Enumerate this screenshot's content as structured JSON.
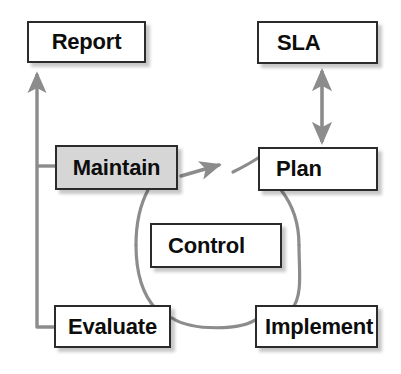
{
  "diagram": {
    "colors": {
      "background": "#ffffff",
      "box_border": "#2b2b2b",
      "box_fill": "#ffffff",
      "highlight_fill": "#d6d6d6",
      "connector": "#8c8c8c",
      "text": "#0d0d0d"
    },
    "nodes": [
      {
        "id": "report",
        "label": "Report",
        "highlighted": false
      },
      {
        "id": "sla",
        "label": "SLA",
        "highlighted": false
      },
      {
        "id": "maintain",
        "label": "Maintain",
        "highlighted": true
      },
      {
        "id": "plan",
        "label": "Plan",
        "highlighted": false
      },
      {
        "id": "control",
        "label": "Control",
        "highlighted": false
      },
      {
        "id": "evaluate",
        "label": "Evaluate",
        "highlighted": false
      },
      {
        "id": "implement",
        "label": "Implement",
        "highlighted": false
      }
    ],
    "connectors": [
      {
        "id": "maintain-to-plan",
        "from": "maintain",
        "to": "plan",
        "style": "arrow-right"
      },
      {
        "id": "plan-to-implement",
        "from": "plan",
        "to": "implement",
        "style": "arc"
      },
      {
        "id": "implement-to-evaluate",
        "from": "implement",
        "to": "evaluate",
        "style": "arc"
      },
      {
        "id": "evaluate-to-maintain",
        "from": "evaluate",
        "to": "maintain",
        "style": "arc"
      },
      {
        "id": "sla-plan-link",
        "from": "sla",
        "to": "plan",
        "style": "double-arrow-vertical"
      },
      {
        "id": "cycle-to-report",
        "from": "evaluate",
        "to": "report",
        "style": "arrow-up-bracket"
      }
    ]
  }
}
